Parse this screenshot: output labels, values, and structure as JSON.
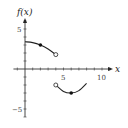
{
  "chart_data": {
    "type": "line",
    "title": "",
    "xlabel": "x",
    "ylabel": "f(x)",
    "xlim": [
      -1.5,
      11.5
    ],
    "ylim": [
      -6,
      6.5
    ],
    "x_ticks_labeled": [
      "5",
      "10"
    ],
    "y_ticks_labeled": [
      "5",
      "−5"
    ],
    "grid": false,
    "series": [
      {
        "name": "left piece",
        "x": [
          0,
          1,
          2,
          3,
          4
        ],
        "y": [
          3.4,
          3.3,
          3.0,
          2.5,
          1.8
        ],
        "start": "none",
        "end": "open-circle",
        "marked_points": [
          {
            "x": 2,
            "y": 3.0,
            "style": "closed-dot"
          }
        ]
      },
      {
        "name": "right piece",
        "x": [
          4,
          5,
          6,
          7,
          8
        ],
        "y": [
          -2.0,
          -2.8,
          -3.0,
          -2.7,
          -1.8
        ],
        "start": "open-circle",
        "end": "none",
        "marked_points": [
          {
            "x": 6,
            "y": -3.0,
            "style": "closed-dot"
          }
        ]
      }
    ]
  },
  "labels": {
    "y_axis": "f(x)",
    "x_axis": "x",
    "x_tick_5": "5",
    "x_tick_10": "10",
    "y_tick_5": "5",
    "y_tick_neg5": "−5"
  }
}
